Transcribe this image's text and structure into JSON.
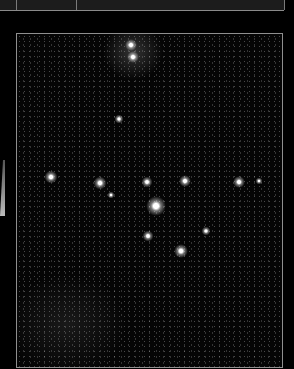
{
  "image": {
    "subject": "starfield-star-cluster",
    "stars": [
      {
        "x": 114,
        "y": 11,
        "size": 12
      },
      {
        "x": 116,
        "y": 23,
        "size": 12
      },
      {
        "x": 102,
        "y": 85,
        "size": 9
      },
      {
        "x": 34,
        "y": 143,
        "size": 13
      },
      {
        "x": 83,
        "y": 149,
        "size": 13
      },
      {
        "x": 94,
        "y": 161,
        "size": 7
      },
      {
        "x": 130,
        "y": 148,
        "size": 11
      },
      {
        "x": 168,
        "y": 147,
        "size": 12
      },
      {
        "x": 139,
        "y": 172,
        "size": 20
      },
      {
        "x": 131,
        "y": 202,
        "size": 11
      },
      {
        "x": 189,
        "y": 197,
        "size": 9
      },
      {
        "x": 164,
        "y": 217,
        "size": 14
      },
      {
        "x": 222,
        "y": 148,
        "size": 12
      },
      {
        "x": 242,
        "y": 147,
        "size": 7
      }
    ]
  }
}
